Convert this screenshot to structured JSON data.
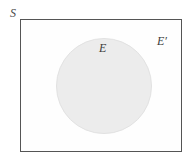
{
  "figure": {
    "type": "venn-diagram",
    "background_color": "#ffffff"
  },
  "sample_space": {
    "label": "S",
    "shape": "rectangle",
    "border_color": "#555555",
    "fill_color": "#fefefe"
  },
  "event": {
    "label": "E",
    "shape": "circle",
    "fill_color": "#ececec",
    "border_color": "#e2e2e2"
  },
  "complement": {
    "label": "E′",
    "region": "inside-rectangle-outside-circle",
    "fill_color": "#fefefe"
  }
}
